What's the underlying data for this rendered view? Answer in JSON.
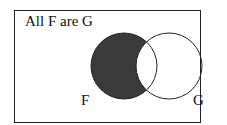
{
  "diagram": {
    "title": "All F are G",
    "circles": [
      {
        "label": "F",
        "cx": 124,
        "cy": 66,
        "r": 33,
        "shading": "shaded outside G"
      },
      {
        "label": "G",
        "cx": 169,
        "cy": 66,
        "r": 33,
        "shading": "none"
      }
    ],
    "colors": {
      "shade": "#3a3a3a",
      "stroke": "#222222",
      "background": "#ffffff"
    }
  }
}
